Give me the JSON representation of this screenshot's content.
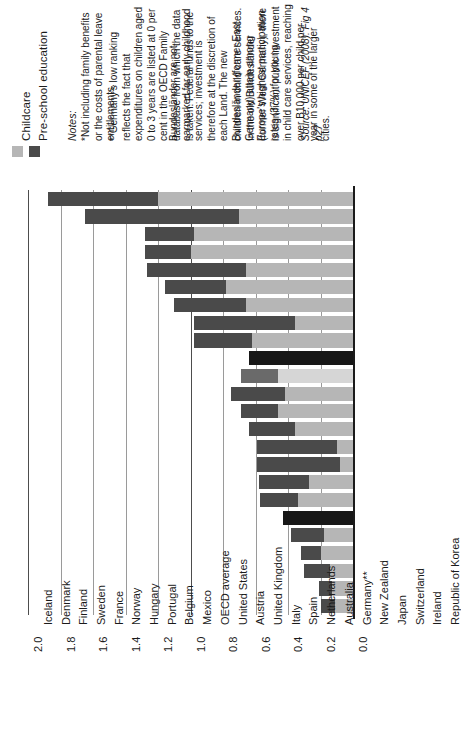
{
  "legend": {
    "items": [
      {
        "label": "Childcare",
        "color": "#b6b6b6",
        "icon": "legend-swatch"
      },
      {
        "label": "Pre-school education",
        "color": "#4a4a4a",
        "icon": "legend-swatch"
      }
    ]
  },
  "notes": {
    "heading": "Notes:",
    "note_a": "*Not including family benefits or the costs of parental leave entitlements.",
    "note_b_part1": "**Germany's low ranking reflects the fact that expenditures on children aged 0 to 3 years are listed at 0 per cent in the OECD Family database from which the data is taken. Federal funds to the",
    "note_b_part2": "Bundesländer are not earmarked for early childhood services; investment is therefore at the discretion of each Land. The new Bundesländer (former East Germany) attain among Europe's highest participation rates (37%) for young",
    "note_b_part3": "children in child care services. In the old Bundesländer (former West Germany), there is significant public investment in child care services, reaching over B10,000 per child per year in some of the larger cities.",
    "source": "Source: UNICEF (2008): Fig 4 p27"
  },
  "chart_data": {
    "type": "bar",
    "orientation": "horizontal-stacked",
    "title": "",
    "xlabel": "",
    "ylabel": "",
    "xlim": [
      0.0,
      2.0
    ],
    "grid": true,
    "tick_labels": [
      "0.0",
      "0.2",
      "0.4",
      "0.6",
      "0.8",
      "1.0",
      "1.2",
      "1.4",
      "1.6",
      "1.8",
      "2.0"
    ],
    "tick_values": [
      0.0,
      0.2,
      0.4,
      0.6,
      0.8,
      1.0,
      1.2,
      1.4,
      1.6,
      1.8,
      2.0
    ],
    "legend_position": "top-left",
    "categories": [
      "Iceland",
      "Denmark",
      "Finland",
      "Sweden",
      "France",
      "Norway",
      "Hungary",
      "Portugal",
      "Belgium",
      "Mexico",
      "OECD average",
      "United States",
      "Austria",
      "United Kingdom",
      "Italy",
      "Spain",
      "Netherlands",
      "Australia",
      "Germany**",
      "New Zealand",
      "Japan",
      "Switzerland",
      "Ireland",
      "Republic of Korea"
    ],
    "series": [
      {
        "name": "Childcare",
        "color": "#b6b6b6",
        "values": [
          1.2,
          0.7,
          0.98,
          1.0,
          0.66,
          0.78,
          0.66,
          0.36,
          0.62,
          0.0,
          0.46,
          0.42,
          0.46,
          0.36,
          0.1,
          0.08,
          0.27,
          0.34,
          0.0,
          0.18,
          0.2,
          0.14,
          0.13,
          0.11
        ]
      },
      {
        "name": "Pre-school education",
        "color": "#4a4a4a",
        "values": [
          0.68,
          0.95,
          0.3,
          0.28,
          0.61,
          0.38,
          0.44,
          0.62,
          0.36,
          0.64,
          0.23,
          0.33,
          0.23,
          0.28,
          0.49,
          0.51,
          0.31,
          0.23,
          0.43,
          0.2,
          0.12,
          0.16,
          0.08,
          0.09
        ]
      }
    ],
    "totals": [
      1.88,
      1.65,
      1.28,
      1.28,
      1.27,
      1.16,
      1.1,
      0.98,
      0.98,
      0.64,
      0.69,
      0.75,
      0.69,
      0.64,
      0.59,
      0.59,
      0.58,
      0.57,
      0.43,
      0.38,
      0.32,
      0.3,
      0.21,
      0.2
    ]
  }
}
